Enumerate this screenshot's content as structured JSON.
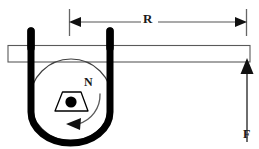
{
  "figure": {
    "type": "physics-diagram",
    "background_color": "#ffffff",
    "ink_color": "#000000",
    "thin_line_color": "#555555",
    "width": 259,
    "height": 149
  },
  "labels": {
    "radius": "R",
    "north_pole": "N",
    "force": "F"
  },
  "dimension_line": {
    "name": "R",
    "label": "R",
    "y": 22,
    "x_start": 69,
    "x_end": 247,
    "arrow_left": true,
    "arrow_right": true,
    "tick_top": 9,
    "tick_bottom": 36
  },
  "lever_bar": {
    "x": 8,
    "y": 45,
    "width": 242,
    "height": 17,
    "fill": "#ffffff",
    "stroke": "#555555"
  },
  "wires": [
    {
      "name": "left-terminal",
      "x": 31,
      "y_top": 29,
      "y_bottom": 62,
      "width": 7
    },
    {
      "name": "right-terminal",
      "x": 110,
      "y_top": 29,
      "y_bottom": 62,
      "width": 7
    }
  ],
  "coil_loop": {
    "name": "u-shaped-coil-wire",
    "left_x": 31,
    "right_x": 110,
    "top_y": 57,
    "bottom_y": 142,
    "stroke_width": 7
  },
  "circle": {
    "name": "magnet-circle",
    "cx": 71,
    "cy": 100,
    "r": 41,
    "stroke": "#444444",
    "stroke_width": 1.2,
    "fill": "none"
  },
  "magnet": {
    "name": "trapezoid-magnet",
    "points": "55,111 62,92 82,92 89,111",
    "stroke": "#000000",
    "fill": "#ffffff",
    "dot_cx": 71,
    "dot_cy": 102,
    "dot_r": 5.5,
    "dot_fill": "#000000"
  },
  "rotation_arrow": {
    "name": "counterclockwise-rotation-arrow",
    "direction": "counterclockwise",
    "stroke": "#555555"
  },
  "force_arrow": {
    "name": "force-arrow-F",
    "x": 247,
    "y_tail": 142,
    "y_head": 60,
    "direction": "up",
    "stroke": "#444444"
  }
}
